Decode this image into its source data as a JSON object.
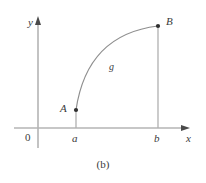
{
  "figure": {
    "caption": "(b)",
    "axes": {
      "x_label": "x",
      "y_label": "y",
      "origin_label": "0",
      "x_axis_y": 128,
      "y_axis_x": 38,
      "x_axis_end": 188,
      "y_axis_top": 20,
      "y_axis_bottom": 148,
      "line_color": "#b4b4b4"
    },
    "points": [
      {
        "name": "A",
        "label": "A",
        "x": 76,
        "y": 110
      },
      {
        "name": "B",
        "label": "B",
        "x": 158,
        "y": 26
      }
    ],
    "ticks": [
      {
        "label": "a",
        "x": 76
      },
      {
        "label": "b",
        "x": 158
      }
    ],
    "curve": {
      "label": "g",
      "from": "A",
      "to": "B",
      "shape": "concave-down arc",
      "color": "#8a8a8a",
      "path": "M 76 110 C 84 60, 110 32, 158 26"
    },
    "drop_lines": [
      {
        "from_point": "A",
        "x": 76,
        "y_top": 110,
        "y_bottom": 128
      },
      {
        "from_point": "B",
        "x": 158,
        "y_top": 26,
        "y_bottom": 128
      }
    ],
    "colors": {
      "axis": "#b4b4b4",
      "curve": "#8a8a8a",
      "drop_line": "#b4b4b4",
      "text": "#3a3a3a",
      "point": "#3a3a3a",
      "background": "#ffffff"
    }
  }
}
